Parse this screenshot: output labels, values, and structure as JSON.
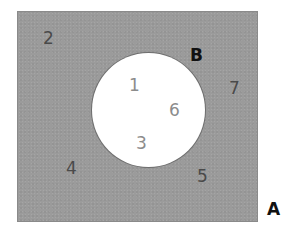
{
  "diagram": {
    "type": "venn",
    "sets": [
      {
        "id": "A",
        "label": "A",
        "role": "universal-set",
        "shape": "rectangle",
        "fill": "#9b9b9b",
        "shaded": true
      },
      {
        "id": "B",
        "label": "B",
        "role": "subset",
        "shape": "circle",
        "fill": "#ffffff",
        "shaded": false
      }
    ],
    "elements": {
      "outside_B": [
        "2",
        "7",
        "4",
        "5"
      ],
      "inside_B": [
        "1",
        "6",
        "3"
      ]
    },
    "labels": {
      "set_a": "A",
      "set_b": "B",
      "n2": "2",
      "n7": "7",
      "n4": "4",
      "n5": "5",
      "n1": "1",
      "n6": "6",
      "n3": "3"
    },
    "colors": {
      "shaded_region": "#9b9b9b",
      "unshaded_region": "#ffffff",
      "outside_digit": "#4a4a4a",
      "inside_digit": "#8c8c8c",
      "set_label": "#111111"
    }
  }
}
